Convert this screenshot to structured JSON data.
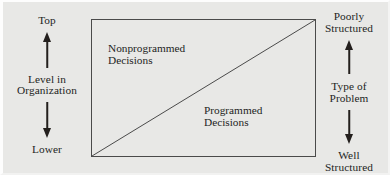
{
  "figure": {
    "name": "decision-type-matrix",
    "background_color": "#e8e8e6",
    "ink_color": "#231f1d",
    "box_border_color": "#4a4a4a"
  },
  "left_axis": {
    "top_label": "Top",
    "title": "Level in\nOrganization",
    "title_line1": "Level in",
    "title_line2": "Organization",
    "bottom_label": "Lower",
    "up_arrow_icon": "arrow-up-icon",
    "down_arrow_icon": "arrow-down-icon"
  },
  "right_axis": {
    "top_label_line1": "Poorly",
    "top_label_line2": "Structured",
    "title_line1": "Type of",
    "title_line2": "Problem",
    "bottom_label_line1": "Well",
    "bottom_label_line2": "Structured",
    "up_arrow_icon": "arrow-up-icon",
    "down_arrow_icon": "arrow-down-icon"
  },
  "matrix": {
    "upper_region_line1": "Nonprogrammed",
    "upper_region_line2": "Decisions",
    "lower_region_line1": "Programmed",
    "lower_region_line2": "Decisions",
    "divider": "diagonal from bottom-left to top-right"
  }
}
